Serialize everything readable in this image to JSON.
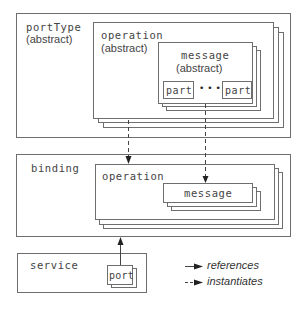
{
  "portType": {
    "title": "portType",
    "subtitle": "(abstract)",
    "operation": {
      "title": "operation",
      "subtitle": "(abstract)",
      "message": {
        "title": "message",
        "subtitle": "(abstract)",
        "parts": [
          "part",
          "part"
        ],
        "ellipsis": "•••"
      }
    }
  },
  "binding": {
    "title": "binding",
    "operation": {
      "title": "operation",
      "message": {
        "title": "message"
      }
    }
  },
  "service": {
    "title": "service",
    "port": {
      "title": "port"
    }
  },
  "legend": {
    "items": [
      {
        "style": "solid",
        "label": "references"
      },
      {
        "style": "dashed",
        "label": "instantiates"
      }
    ]
  },
  "colors": {
    "line": "#6e6e6e",
    "text": "#444444",
    "background": "#ffffff"
  }
}
